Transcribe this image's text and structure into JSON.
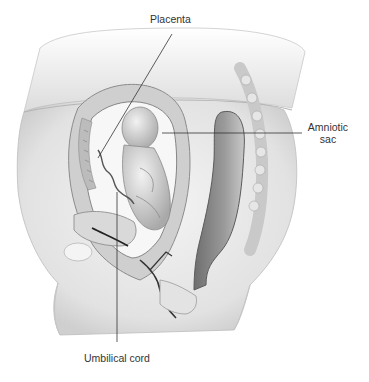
{
  "figure": {
    "type": "anatomical-illustration",
    "palette": {
      "background": "#ffffff",
      "skin_light": "#ececec",
      "skin_mid": "#d6d6d6",
      "tissue_dark": "#8a8a8a",
      "line": "#333333",
      "text": "#333333"
    }
  },
  "labels": [
    {
      "id": "placenta",
      "lines": [
        "Placenta"
      ]
    },
    {
      "id": "amniotic_sac",
      "lines": [
        "Amniotic",
        "sac"
      ]
    },
    {
      "id": "umbilical_cord",
      "lines": [
        "Umbilical cord"
      ]
    }
  ]
}
